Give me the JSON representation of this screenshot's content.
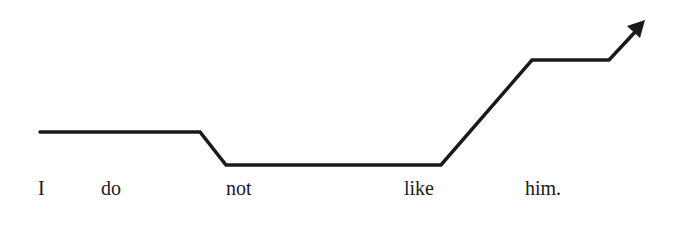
{
  "diagram": {
    "sentence": "I do not like him.",
    "words": [
      {
        "text": "I",
        "x": 38
      },
      {
        "text": "do",
        "x": 101
      },
      {
        "text": "not",
        "x": 226
      },
      {
        "text": "like",
        "x": 404
      },
      {
        "text": "him.",
        "x": 525
      }
    ],
    "contour_points": [
      [
        40,
        132
      ],
      [
        200,
        132
      ],
      [
        226,
        165
      ],
      [
        441,
        165
      ],
      [
        532,
        60
      ],
      [
        609,
        60
      ],
      [
        636,
        30
      ]
    ],
    "arrow_tip": [
      645,
      21
    ],
    "line_color": "#1a1a1a",
    "background": "#ffffff"
  }
}
